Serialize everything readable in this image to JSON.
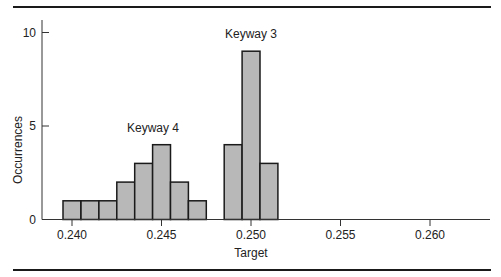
{
  "chart_data": {
    "type": "bar",
    "subtype": "histogram",
    "title": "",
    "xlabel": "Target",
    "ylabel": "Occurrences",
    "xlim": [
      0.2385,
      0.2635
    ],
    "ylim": [
      0,
      10.5
    ],
    "x_ticks": [
      0.24,
      0.245,
      0.25,
      0.255,
      0.26
    ],
    "x_tick_labels": [
      "0.240",
      "0.245",
      "0.250",
      "0.255",
      "0.260"
    ],
    "y_ticks": [
      0,
      5,
      10
    ],
    "y_tick_labels": [
      "0",
      "5",
      "10"
    ],
    "bin_width": 0.001,
    "grid": false,
    "legend": null,
    "bar_color": "#b8b8b8",
    "edge_color": "#1a1a1a",
    "series": [
      {
        "name": "Keyway 4",
        "bin_centers": [
          0.24,
          0.241,
          0.242,
          0.243,
          0.244,
          0.245,
          0.246,
          0.247
        ],
        "values": [
          1,
          1,
          1,
          2,
          3,
          4,
          2,
          1
        ]
      },
      {
        "name": "Keyway 3",
        "bin_centers": [
          0.249,
          0.25,
          0.251
        ],
        "values": [
          4,
          9,
          3
        ]
      }
    ],
    "annotations": [
      {
        "text": "Keyway 4",
        "x": 0.2445,
        "y": 5
      },
      {
        "text": "Keyway 3",
        "x": 0.25,
        "y": 10
      }
    ]
  }
}
